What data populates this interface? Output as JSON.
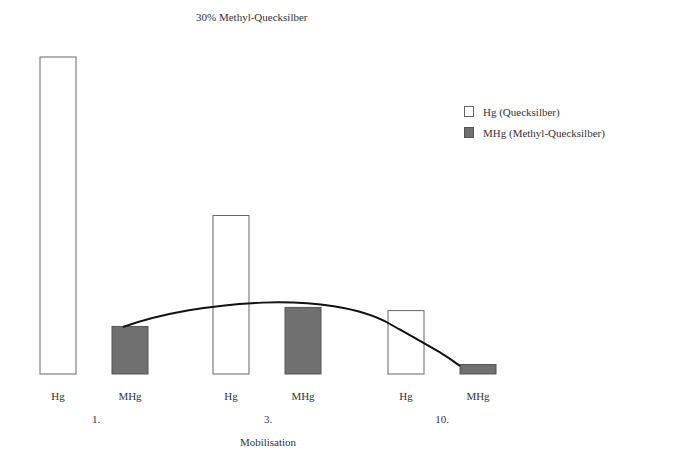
{
  "chart_data": {
    "type": "bar",
    "title": "30% Methyl-Quecksilber",
    "xlabel": "Mobilisation",
    "ylabel": "",
    "categories": [
      "1.",
      "3.",
      "10."
    ],
    "bar_labels": [
      "Hg",
      "MHg"
    ],
    "series": [
      {
        "name": "Hg (Quecksilber)",
        "short": "Hg",
        "values": [
          100,
          50,
          20
        ],
        "color": "#ffffff"
      },
      {
        "name": "MHg (Methyl-Quecksilber)",
        "short": "MHg",
        "values": [
          15,
          21,
          3
        ],
        "color": "#707070"
      }
    ],
    "trend_line": {
      "series": "MHg",
      "shape": "curve",
      "description": "arc connecting tops of MHg bars"
    },
    "y_units": "relative (no axis shown)",
    "ylim": [
      0,
      100
    ],
    "grid": false,
    "legend_position": "upper right"
  },
  "legend": {
    "items": [
      {
        "label": "Hg (Quecksilber)"
      },
      {
        "label": "MHg (Methyl-Quecksilber)"
      }
    ]
  },
  "colors": {
    "hg_fill": "#ffffff",
    "mhg_fill": "#707070",
    "outline": "#666666",
    "curve": "#111111"
  }
}
